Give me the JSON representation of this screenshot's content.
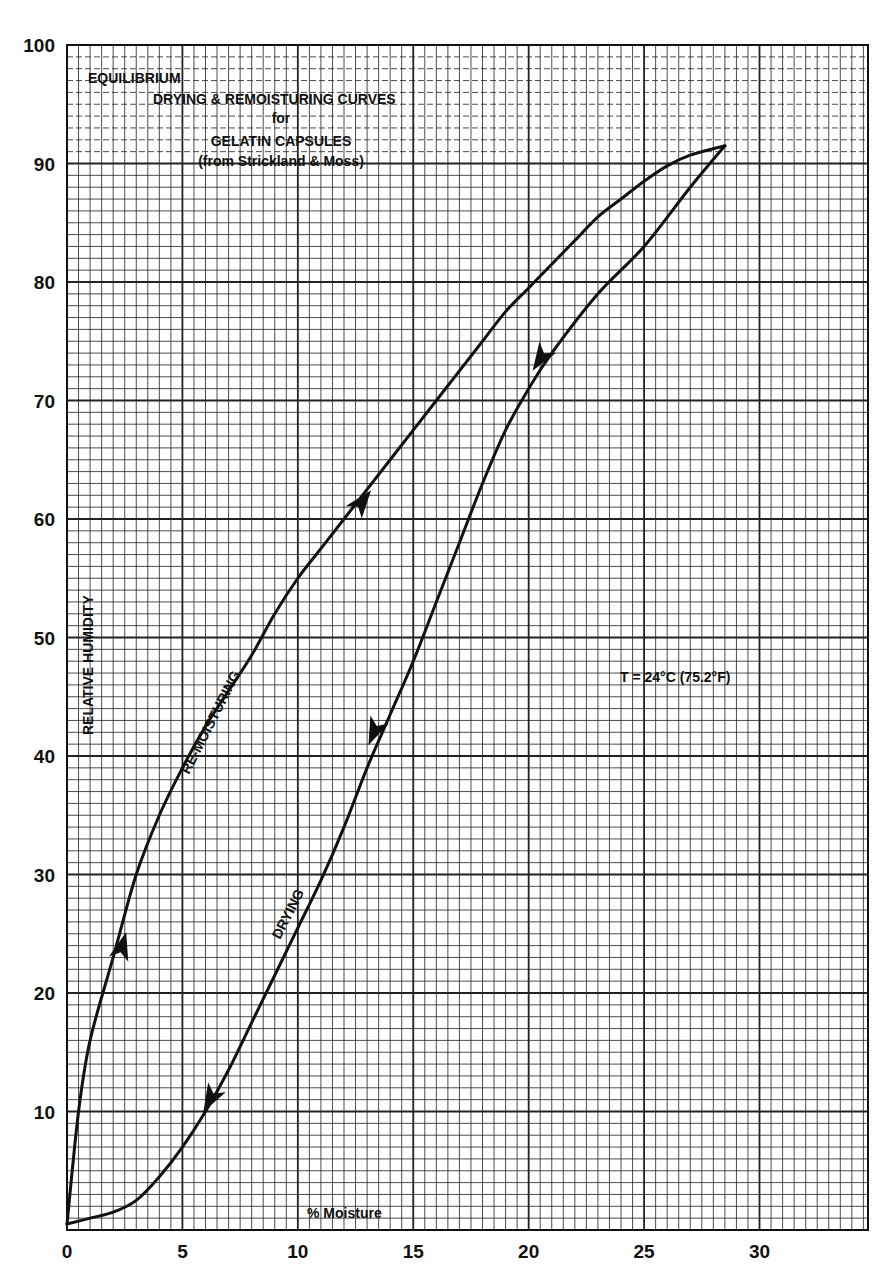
{
  "chart_data": {
    "type": "line",
    "title": [
      "EQUILIBRIUM",
      "DRYING & REMOISTURING CURVES",
      "for",
      "GELATIN CAPSULES",
      "(from Strickland & Moss)"
    ],
    "xlabel": "% Moisture",
    "ylabel": "RELATIVE HUMIDITY",
    "xlim": [
      0,
      34.7
    ],
    "ylim": [
      0,
      100
    ],
    "x_ticks": [
      0,
      5,
      10,
      15,
      20,
      25,
      30
    ],
    "y_ticks": [
      10,
      20,
      30,
      40,
      50,
      60,
      70,
      80,
      90,
      100
    ],
    "grid": {
      "major_x": 5,
      "minor_x": 0.5,
      "major_y": 10,
      "minor_y": 1
    },
    "annotation": "T = 24°C (75.2°F)",
    "series": [
      {
        "name": "RE-MOISTURING",
        "direction": "increasing",
        "points": [
          [
            0,
            0.5
          ],
          [
            0.5,
            10
          ],
          [
            1,
            16
          ],
          [
            2,
            23
          ],
          [
            3,
            30
          ],
          [
            4,
            35
          ],
          [
            5,
            39
          ],
          [
            6,
            42.5
          ],
          [
            7,
            45.5
          ],
          [
            8,
            48.5
          ],
          [
            9,
            52
          ],
          [
            10,
            55
          ],
          [
            11,
            57.5
          ],
          [
            12,
            60
          ],
          [
            13,
            62.5
          ],
          [
            14,
            65
          ],
          [
            15,
            67.5
          ],
          [
            16,
            70
          ],
          [
            17,
            72.5
          ],
          [
            18,
            75
          ],
          [
            19,
            77.5
          ],
          [
            20,
            79.5
          ],
          [
            21,
            81.5
          ],
          [
            22,
            83.5
          ],
          [
            23,
            85.5
          ],
          [
            24,
            87
          ],
          [
            25,
            88.5
          ],
          [
            26,
            89.8
          ],
          [
            27,
            90.7
          ],
          [
            28.5,
            91.5
          ]
        ],
        "arrows_at": [
          [
            2.4,
            24
          ],
          [
            12.8,
            61.5
          ]
        ]
      },
      {
        "name": "DRYING",
        "direction": "decreasing",
        "points": [
          [
            28.5,
            91.5
          ],
          [
            27,
            88
          ],
          [
            25,
            83
          ],
          [
            23,
            79
          ],
          [
            21,
            74
          ],
          [
            20,
            71
          ],
          [
            19,
            67.5
          ],
          [
            18,
            63
          ],
          [
            17,
            58
          ],
          [
            16,
            53
          ],
          [
            15,
            48
          ],
          [
            14,
            43.5
          ],
          [
            13,
            39
          ],
          [
            12,
            34
          ],
          [
            11,
            29.5
          ],
          [
            10,
            25.5
          ],
          [
            9,
            21.5
          ],
          [
            8,
            17.5
          ],
          [
            7,
            13.5
          ],
          [
            6,
            10
          ],
          [
            5,
            7
          ],
          [
            4,
            4.5
          ],
          [
            3,
            2.5
          ],
          [
            2,
            1.5
          ],
          [
            1,
            1
          ],
          [
            0,
            0.5
          ]
        ],
        "arrows_at": [
          [
            20.5,
            73.5
          ],
          [
            13.3,
            42
          ],
          [
            6.2,
            11
          ]
        ]
      }
    ]
  },
  "labels": {
    "title_line1": "EQUILIBRIUM",
    "title_line2": "DRYING & REMOISTURING CURVES",
    "title_line3": "for",
    "title_line4": "GELATIN CAPSULES",
    "title_line5": "(from Strickland & Moss)",
    "xlabel": "% Moisture",
    "ylabel": "RELATIVE HUMIDITY",
    "remoist_label": "RE-MOISTURING",
    "drying_label": "DRYING",
    "temperature": "T = 24°C (75.2°F)"
  }
}
